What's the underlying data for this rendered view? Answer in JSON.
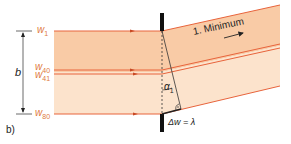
{
  "figure": {
    "panel_label": "b)",
    "wavefront_labels": {
      "w1": "w",
      "w1_sub": "1",
      "w40": "w",
      "w40_sub": "40",
      "w41": "w",
      "w41_sub": "41",
      "w80": "w",
      "w80_sub": "80"
    },
    "width_label": "b",
    "minimum_label": "1. Minimum",
    "angle_label": "α",
    "angle_sub": "1",
    "path_difference_label": "Δw = λ",
    "colors": {
      "wavefront_line": "#e8643c",
      "band_upper": "#f9cba6",
      "band_lower": "#fce3cc",
      "label_orange": "#e07a3c",
      "slit": "#111111",
      "text": "#222222"
    }
  }
}
